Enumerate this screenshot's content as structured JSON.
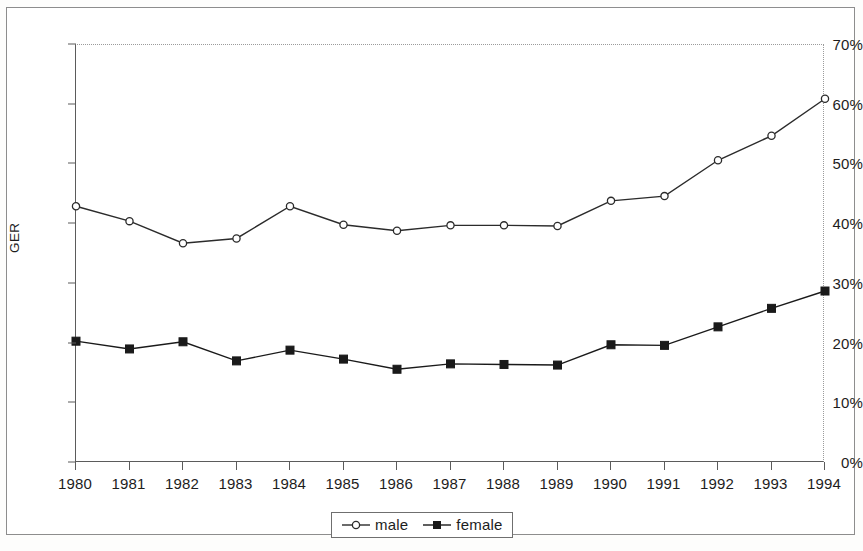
{
  "chart_data": {
    "type": "line",
    "title": "",
    "xlabel": "",
    "ylabel": "GER",
    "categories": [
      "1980",
      "1981",
      "1982",
      "1983",
      "1984",
      "1985",
      "1986",
      "1987",
      "1988",
      "1989",
      "1990",
      "1991",
      "1992",
      "1993",
      "1994"
    ],
    "series": [
      {
        "name": "male",
        "marker": "open-circle",
        "color": "#2b2b2b",
        "values": [
          43.0,
          40.5,
          36.8,
          37.6,
          43.0,
          39.9,
          38.9,
          39.8,
          39.8,
          39.7,
          43.9,
          44.7,
          50.7,
          54.8,
          61.0
        ]
      },
      {
        "name": "female",
        "marker": "filled-square",
        "color": "#1a1a1a",
        "values": [
          20.4,
          19.1,
          20.3,
          17.1,
          18.9,
          17.4,
          15.7,
          16.6,
          16.5,
          16.4,
          19.8,
          19.7,
          22.8,
          25.9,
          28.8
        ]
      }
    ],
    "ylim": [
      0,
      70
    ],
    "y_ticks": [
      0,
      10,
      20,
      30,
      40,
      50,
      60,
      70
    ],
    "y_tick_labels": [
      "0%",
      "10%",
      "20%",
      "30%",
      "40%",
      "50%",
      "60%",
      "70%"
    ],
    "grid": false,
    "legend_position": "bottom-center",
    "value_suffix": "%"
  },
  "legend": {
    "entries": [
      {
        "label": "male"
      },
      {
        "label": "female"
      }
    ]
  },
  "axes": {
    "y_title": "GER"
  }
}
